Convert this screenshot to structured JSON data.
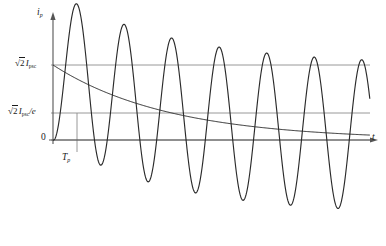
{
  "figure": {
    "kind": "line-plot",
    "background": "#ffffff",
    "stroke_color": "#2b2b2b",
    "guide_color": "#8c8c8c",
    "axis_color": "#555555"
  },
  "labels": {
    "y_axis": {
      "symbol": "i",
      "subscript": "p"
    },
    "x_axis": {
      "symbol": "t"
    },
    "origin": "0",
    "tick_upper": {
      "radical": "2",
      "symbol": "I",
      "subscript": "psc"
    },
    "tick_lower": {
      "radical": "2",
      "symbol": "I",
      "subscript": "psc",
      "divisor": "/e"
    },
    "period_marker": {
      "symbol": "T",
      "subscript": "p"
    }
  },
  "chart_data": {
    "type": "line",
    "title": "",
    "xlabel": "t",
    "ylabel": "i_p",
    "grid": false,
    "legend": null,
    "axes": {
      "x_origin_px": 53,
      "x_end_px": 370,
      "y_zero_px": 140,
      "y_top_px": 14,
      "period_px": 47.5,
      "cycles": 7
    },
    "y_reference_lines": [
      {
        "label": "sqrt(2) I_psc",
        "value": 1.0,
        "y_px": 65
      },
      {
        "label": "sqrt(2) I_psc/e",
        "value": 0.368,
        "y_px": 113
      },
      {
        "label": "0",
        "value": 0.0,
        "y_px": 140
      }
    ],
    "x_markers": [
      {
        "label": "T_p",
        "x_px": 77,
        "y_top_px": 113,
        "y_bottom_px": 152
      }
    ],
    "series": [
      {
        "name": "asymmetrical short-circuit current",
        "model": "i = sqrt(2)*Ipsc*( exp(-t/Tp) - cos(2*pi*t/T) )",
        "amplitude": 1.0,
        "time_constant_periods": 2.45,
        "peaks_y_px": [
          33,
          52,
          58,
          61,
          62,
          63,
          63
        ],
        "troughs_y_px": [
          208,
          214,
          217,
          218,
          219,
          219,
          219
        ]
      },
      {
        "name": "dc decay envelope",
        "model": "sqrt(2)*Ipsc*exp(-t/Tp)",
        "start_value": 1.0,
        "time_constant_periods": 2.45,
        "y_start_px": 65,
        "y_end_px": 139
      }
    ]
  }
}
